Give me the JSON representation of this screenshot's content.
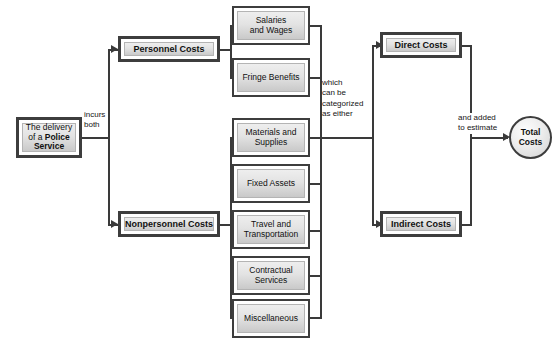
{
  "diagram": {
    "colors": {
      "line": "#3a3a3a",
      "box_border": "#3d3d3d",
      "box_fill_light": "#eeeeee",
      "box_fill_dark": "#c9c9c9",
      "text": "#111111",
      "background": "#ffffff"
    }
  },
  "source": {
    "line1_prefix": "The delivery",
    "line2_prefix": "of a ",
    "line2_bold": "Police",
    "line3_bold": "Service"
  },
  "edge_labels": {
    "incurs_both": "incurs\nboth",
    "categorized": "which\ncan be\ncategorized\nas either",
    "added": "and added\nto estimate"
  },
  "cost_types": [
    {
      "id": "personnel",
      "label": "Personnel Costs"
    },
    {
      "id": "nonpersonnel",
      "label": "Nonpersonnel Costs"
    }
  ],
  "personnel_items": [
    {
      "id": "salaries",
      "label": "Salaries\nand Wages"
    },
    {
      "id": "fringe",
      "label": "Fringe Benefits"
    }
  ],
  "nonpersonnel_items": [
    {
      "id": "materials",
      "label": "Materials and\nSupplies"
    },
    {
      "id": "fixed-assets",
      "label": "Fixed Assets"
    },
    {
      "id": "travel",
      "label": "Travel and\nTransportation"
    },
    {
      "id": "contractual",
      "label": "Contractual\nServices"
    },
    {
      "id": "miscellaneous",
      "label": "Miscellaneous"
    }
  ],
  "categories": [
    {
      "id": "direct",
      "label": "Direct Costs"
    },
    {
      "id": "indirect",
      "label": "Indirect Costs"
    }
  ],
  "total": {
    "label": "Total\nCosts"
  }
}
